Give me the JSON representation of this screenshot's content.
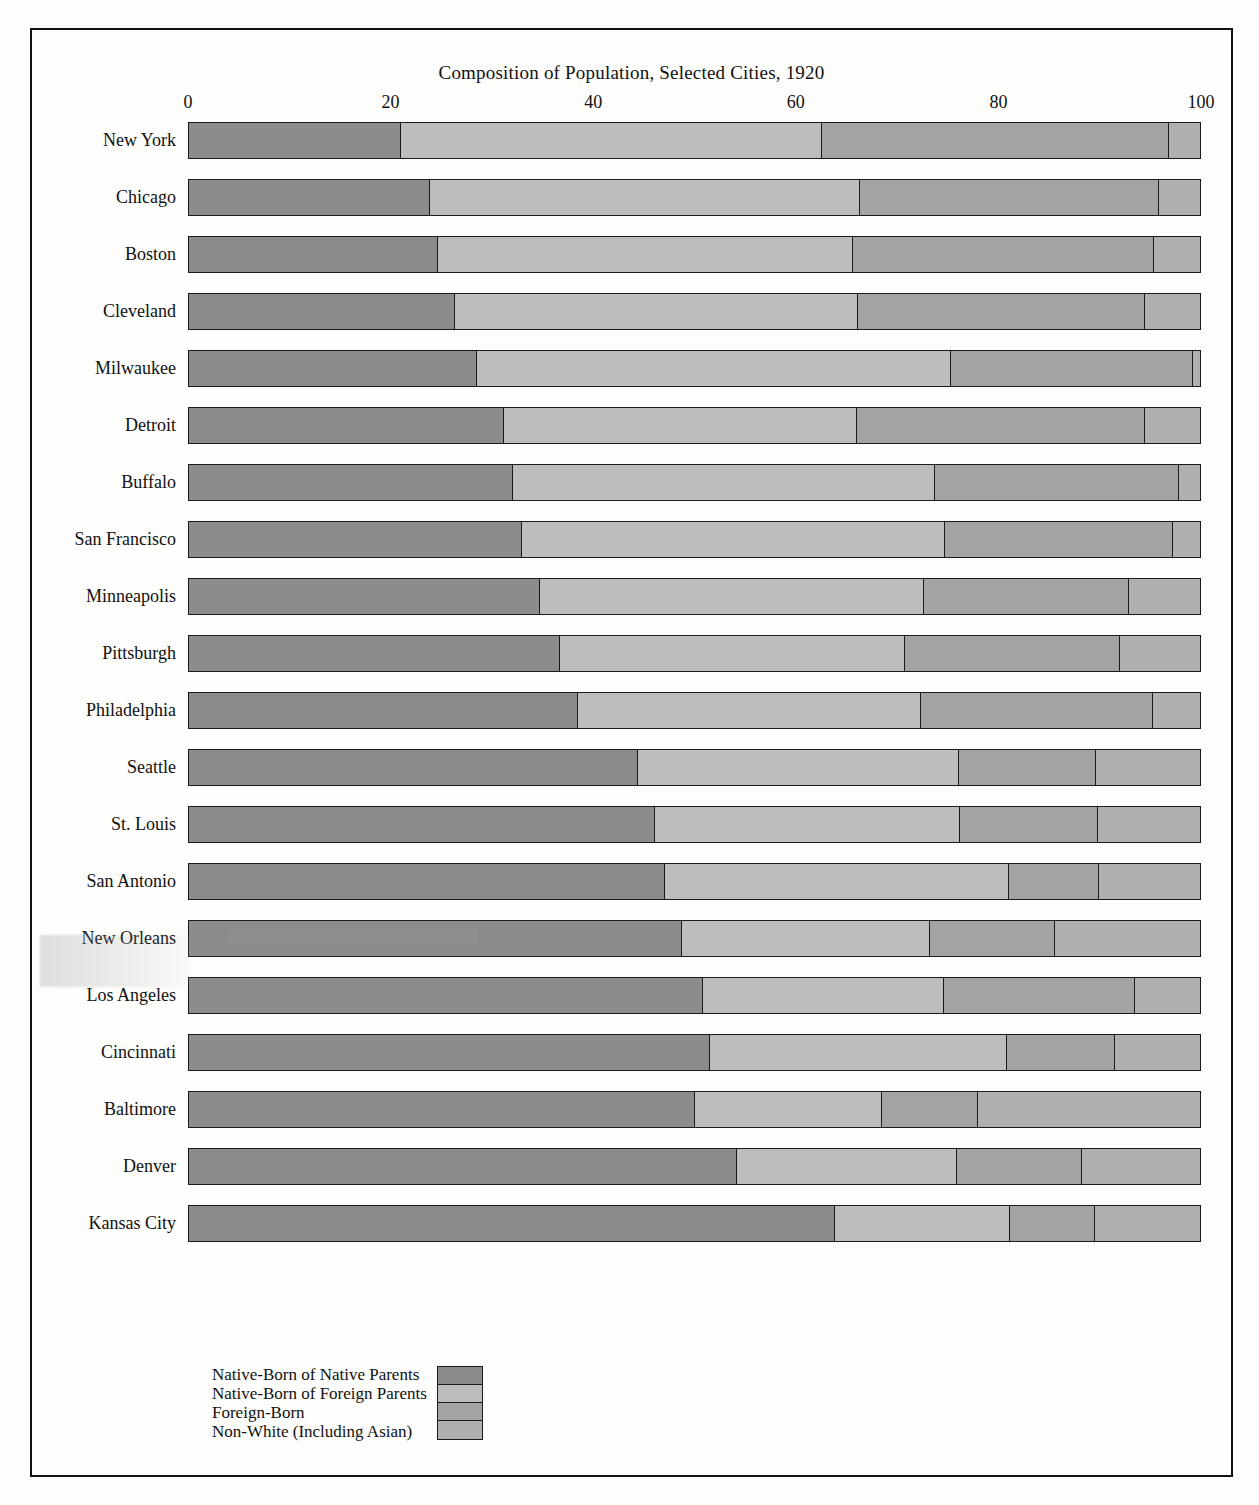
{
  "chart_data": {
    "type": "bar",
    "subtype": "horizontal-stacked-percent",
    "title": "Composition of Population, Selected Cities, 1920",
    "xlabel": "",
    "ylabel": "",
    "xlim": [
      0,
      100
    ],
    "xticks": [
      0,
      20,
      40,
      60,
      80,
      100
    ],
    "xtick_labels": [
      "0",
      "20",
      "40",
      "60",
      "80",
      "100"
    ],
    "grid": false,
    "legend_position": "bottom-left",
    "series": [
      {
        "name": "Native-Born of Native Parents",
        "color": "#8c8c8c",
        "values": [
          21.0,
          23.8,
          24.6,
          26.3,
          28.5,
          31.2,
          32.0,
          32.9,
          34.7,
          36.7,
          38.5,
          44.4,
          46.1,
          47.1,
          48.8,
          50.8,
          51.5,
          50.0,
          54.2,
          63.9
        ]
      },
      {
        "name": "Native-Born of Foreign Parents",
        "color": "#bdbdbd",
        "values": [
          41.6,
          42.6,
          41.1,
          39.9,
          46.9,
          34.9,
          41.8,
          41.9,
          38.0,
          34.1,
          33.9,
          31.8,
          30.2,
          34.0,
          24.5,
          23.9,
          29.4,
          18.5,
          21.8,
          17.3
        ]
      },
      {
        "name": "Foreign-Born",
        "color": "#a3a3a3",
        "values": [
          34.3,
          29.5,
          29.8,
          28.4,
          23.9,
          28.5,
          24.1,
          22.5,
          20.3,
          21.3,
          23.0,
          13.5,
          13.6,
          8.9,
          12.4,
          18.9,
          10.7,
          9.5,
          12.3,
          8.4
        ]
      },
      {
        "name": "Non-White (Including Asian)",
        "color": "#b0b0b0",
        "values": [
          3.1,
          4.1,
          4.5,
          5.4,
          0.7,
          5.4,
          2.1,
          2.7,
          7.0,
          7.9,
          4.6,
          10.3,
          10.1,
          10.0,
          14.3,
          6.4,
          8.4,
          22.0,
          11.7,
          10.4
        ]
      }
    ],
    "categories": [
      "New York",
      "Chicago",
      "Boston",
      "Cleveland",
      "Milwaukee",
      "Detroit",
      "Buffalo",
      "San Francisco",
      "Minneapolis",
      "Pittsburgh",
      "Philadelphia",
      "Seattle",
      "St. Louis",
      "San Antonio",
      "New Orleans",
      "Los Angeles",
      "Cincinnati",
      "Baltimore",
      "Denver",
      "Kansas City"
    ]
  },
  "legend": {
    "items": [
      {
        "label": "Native-Born of Native Parents",
        "color": "#8c8c8c"
      },
      {
        "label": "Native-Born of Foreign Parents",
        "color": "#bdbdbd"
      },
      {
        "label": "Foreign-Born",
        "color": "#a3a3a3"
      },
      {
        "label": "Non-White (Including Asian)",
        "color": "#b0b0b0"
      }
    ]
  }
}
